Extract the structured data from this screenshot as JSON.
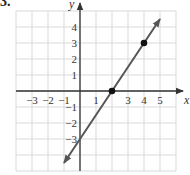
{
  "problem": {
    "number": "3."
  },
  "chart_data": {
    "type": "line",
    "title": "",
    "xlabel": "x",
    "ylabel": "y",
    "xlim": [
      -4,
      6
    ],
    "ylim": [
      -5,
      5
    ],
    "grid": true,
    "x_tick_labels": [
      "−3",
      "−2",
      "−1",
      "1",
      "3",
      "4",
      "5"
    ],
    "y_tick_labels": [
      "4",
      "3",
      "2",
      "1",
      "−1",
      "−2",
      "−3"
    ],
    "series": [
      {
        "name": "line",
        "equation": "y = 1.5x - 3",
        "slope": 1.5,
        "intercept": -3,
        "x": [
          -1,
          5
        ],
        "y": [
          -4.5,
          4.5
        ],
        "arrows_both_ends": true,
        "color": "#555555"
      }
    ],
    "points": [
      {
        "x": 2,
        "y": 0
      },
      {
        "x": 4,
        "y": 3
      }
    ]
  }
}
